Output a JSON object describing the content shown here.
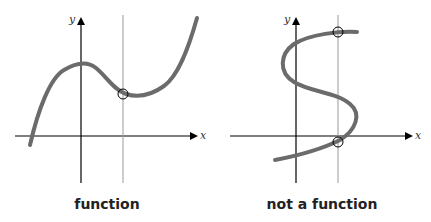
{
  "panels": [
    {
      "caption": "function",
      "x_axis_label": "x",
      "y_axis_label": "y",
      "description": "Cubic-like curve; vertical line test crosses curve once"
    },
    {
      "caption": "not a function",
      "x_axis_label": "x",
      "y_axis_label": "y",
      "description": "S-shaped curve; vertical line test crosses curve twice"
    }
  ],
  "colors": {
    "curve": "#6b6b6b",
    "axis": "#000000",
    "test_line": "#9a9a9a"
  }
}
